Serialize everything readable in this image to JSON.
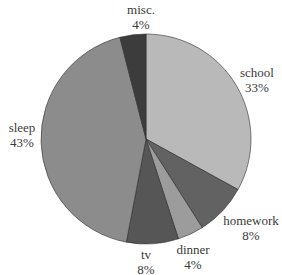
{
  "chart_data": {
    "type": "pie",
    "title": "",
    "start_angle_deg": 0,
    "direction": "clockwise",
    "center": [
      146,
      139
    ],
    "radius": 105,
    "slices": [
      {
        "label": "school",
        "value": 33,
        "display": "33%",
        "color": "#b9b9b9"
      },
      {
        "label": "homework",
        "value": 8,
        "display": "8%",
        "color": "#626262"
      },
      {
        "label": "dinner",
        "value": 4,
        "display": "4%",
        "color": "#9c9c9c"
      },
      {
        "label": "tv",
        "value": 8,
        "display": "8%",
        "color": "#565656"
      },
      {
        "label": "sleep",
        "value": 43,
        "display": "43%",
        "color": "#8c8c8c"
      },
      {
        "label": "misc.",
        "value": 4,
        "display": "4%",
        "color": "#3c3c3c"
      }
    ]
  },
  "labels": {
    "school": {
      "name": "school",
      "pct": "33%"
    },
    "homework": {
      "name": "homework",
      "pct": "8%"
    },
    "dinner": {
      "name": "dinner",
      "pct": "4%"
    },
    "tv": {
      "name": "tv",
      "pct": "8%"
    },
    "sleep": {
      "name": "sleep",
      "pct": "43%"
    },
    "misc": {
      "name": "misc.",
      "pct": "4%"
    }
  }
}
